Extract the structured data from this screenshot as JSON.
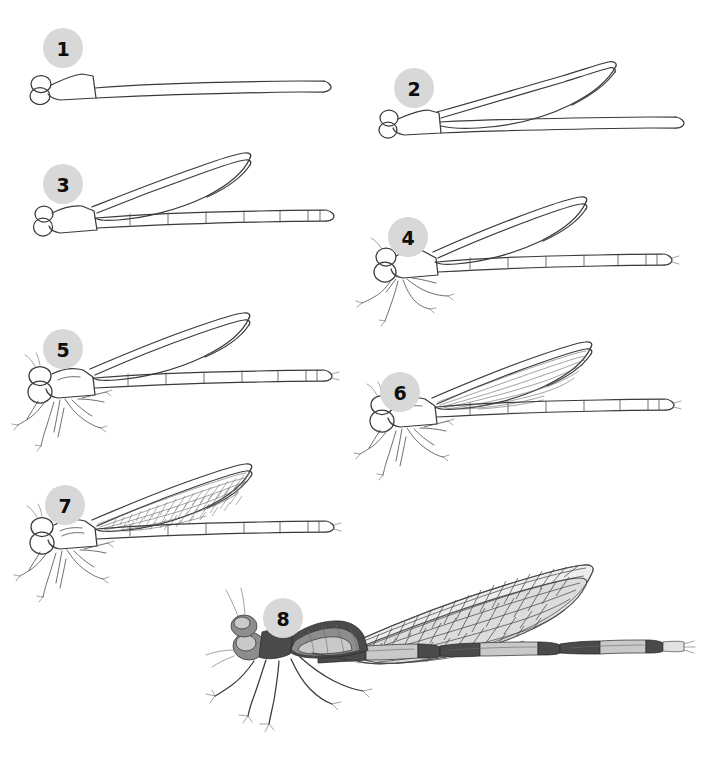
{
  "page": {
    "background_color": "#ffffff",
    "width": 709,
    "height": 767,
    "total_steps": 8,
    "line_color": "#3a3a3a",
    "badge_fill_color": "#d8d8d8",
    "badge_text_color": "#0d0d0d"
  },
  "steps": [
    {
      "number": "1",
      "badge_x": 63,
      "badge_y": 48,
      "description": "Basic head circles, wedge thorax and a long straight abdomen line"
    },
    {
      "number": "2",
      "badge_x": 414,
      "badge_y": 88,
      "description": "Add the long tapered wing outline sweeping up and back"
    },
    {
      "number": "3",
      "badge_x": 63,
      "badge_y": 184,
      "description": "Outline the abdomen with segment divisions and the tail tip"
    },
    {
      "number": "4",
      "badge_x": 408,
      "badge_y": 237,
      "description": "Refine head and eyes, add the six thin jointed legs"
    },
    {
      "number": "5",
      "badge_x": 63,
      "badge_y": 349,
      "description": "Shape the thorax, detail leg joints and tarsal claws"
    },
    {
      "number": "6",
      "badge_x": 400,
      "badge_y": 392,
      "description": "Draw the long longitudinal veins inside the wings"
    },
    {
      "number": "7",
      "badge_x": 65,
      "badge_y": 505,
      "description": "Fill the wings with the cross-vein mesh network"
    },
    {
      "number": "8",
      "badge_x": 283,
      "badge_y": 618,
      "description": "Shade the body with tone: dark banded abdomen and shaded wings"
    }
  ]
}
